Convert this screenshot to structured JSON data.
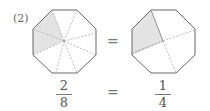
{
  "problem": {
    "label": "(2)",
    "left": {
      "shape": "octagon",
      "divisions": 8,
      "shaded": 2,
      "fraction": {
        "numerator": "2",
        "denominator": "8"
      }
    },
    "right": {
      "shape": "octagon",
      "divisions": 4,
      "shaded": 1,
      "fraction": {
        "numerator": "1",
        "denominator": "4"
      }
    },
    "equals_top": "=",
    "equals_bottom": "=",
    "colors": {
      "outline": "#666666",
      "shade": "#e3e3e3",
      "dash": "#aaaaaa"
    }
  }
}
